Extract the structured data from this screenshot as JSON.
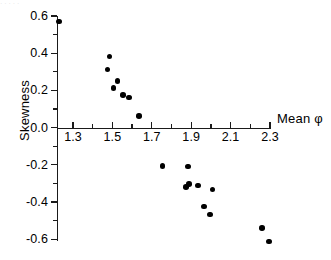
{
  "figure": {
    "name": "skewness-vs-mean-phi-scatter",
    "background": "#ffffff",
    "marker_color": "#000000",
    "axis_color": "#1a1a1a",
    "artifact_text": "·   ·    ·   ·       ·"
  },
  "chart_data": {
    "type": "scatter",
    "title": "",
    "subtitle": "",
    "xlabel": "Mean φ",
    "ylabel": "Skewness",
    "xlim": [
      1.2,
      2.35
    ],
    "ylim": [
      -0.65,
      0.62
    ],
    "grid": false,
    "legend": null,
    "x_ticks": [
      1.3,
      1.5,
      1.7,
      1.9,
      2.1,
      2.3
    ],
    "x_tick_labels": [
      "1.3",
      "1.5",
      "1.7",
      "1.9",
      "2.1",
      "2.3"
    ],
    "x_minor_ticks": [
      1.4,
      1.6,
      1.8,
      2.0,
      2.2
    ],
    "y_ticks": [
      0.6,
      0.4,
      0.2,
      0.0,
      -0.2,
      -0.4,
      -0.6
    ],
    "y_tick_labels": [
      "0.6",
      "0.4",
      "0.2",
      "0.0",
      "-0.2",
      "-0.4",
      "-0.6"
    ],
    "y_minor_ticks": [
      0.5,
      0.3,
      0.1,
      -0.1,
      -0.3,
      -0.5
    ],
    "marker": "filled-circle",
    "marker_size": 5.6,
    "points": [
      {
        "x": 1.23,
        "y": 0.57
      },
      {
        "x": 1.485,
        "y": 0.383
      },
      {
        "x": 1.475,
        "y": 0.313
      },
      {
        "x": 1.525,
        "y": 0.252
      },
      {
        "x": 1.505,
        "y": 0.212
      },
      {
        "x": 1.555,
        "y": 0.176
      },
      {
        "x": 1.585,
        "y": 0.162
      },
      {
        "x": 1.635,
        "y": 0.062
      },
      {
        "x": 1.755,
        "y": -0.205
      },
      {
        "x": 1.885,
        "y": -0.209
      },
      {
        "x": 1.875,
        "y": -0.318
      },
      {
        "x": 1.888,
        "y": -0.303
      },
      {
        "x": 1.935,
        "y": -0.312
      },
      {
        "x": 2.008,
        "y": -0.332
      },
      {
        "x": 1.965,
        "y": -0.424
      },
      {
        "x": 1.995,
        "y": -0.468
      },
      {
        "x": 2.258,
        "y": -0.539
      },
      {
        "x": 2.295,
        "y": -0.612
      }
    ]
  }
}
